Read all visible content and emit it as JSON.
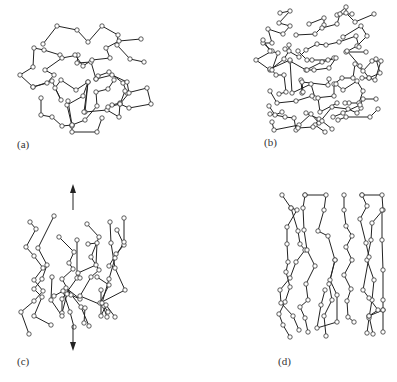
{
  "figure": {
    "panels": [
      {
        "id": "a",
        "label": "(a)",
        "description": "Random coil polymer network (amorphous, unstretched)"
      },
      {
        "id": "b",
        "label": "(b)",
        "description": "Random polymer chains, dispersed"
      },
      {
        "id": "c",
        "label": "(c)",
        "description": "Chains partially aligned under vertical stretching",
        "arrows": [
          "up",
          "down"
        ]
      },
      {
        "id": "d",
        "label": "(d)",
        "description": "Chains aligned vertically with crosslinks"
      }
    ],
    "colors": {
      "line": "#222222",
      "node_fill": "#ffffff",
      "node_stroke": "#333333",
      "background": "#ffffff"
    }
  }
}
